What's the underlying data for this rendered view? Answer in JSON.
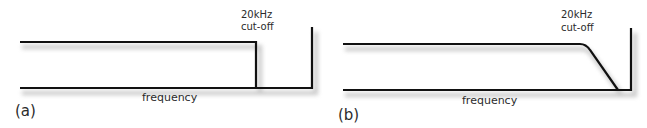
{
  "panels": [
    {
      "id": "a",
      "panel_label": "(a)",
      "cutoff_line1": "20kHz",
      "cutoff_line2": "cut-off",
      "x_axis_label": "frequency",
      "response": "brick-wall"
    },
    {
      "id": "b",
      "panel_label": "(b)",
      "cutoff_line1": "20kHz",
      "cutoff_line2": "cut-off",
      "x_axis_label": "frequency",
      "response": "gradual roll-off"
    }
  ],
  "colors": {
    "line": "#111111",
    "shadow": "#bdbdbd",
    "text": "#2b2b2b"
  }
}
